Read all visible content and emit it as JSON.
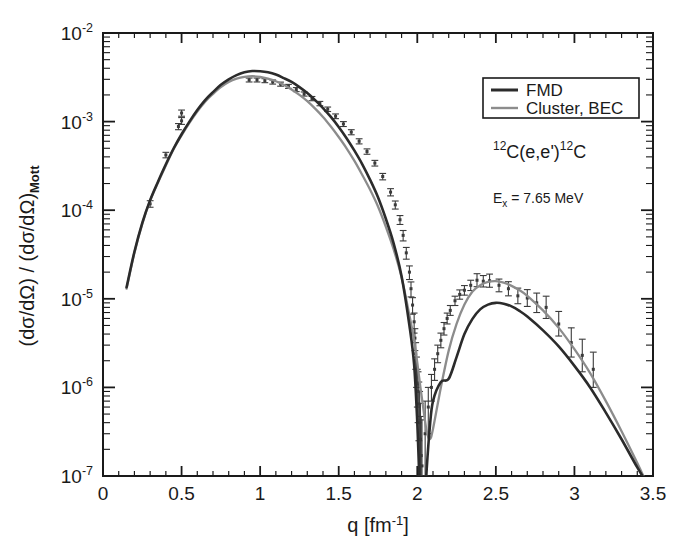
{
  "figure": {
    "title": "",
    "background": "#ffffff",
    "frame_color": "#1a1a1a"
  },
  "axes": {
    "x": {
      "label_main": "q [fm",
      "label_sup": "-1",
      "label_close": "]",
      "label_full": "q [fm-1]",
      "ticks": [
        "0",
        "0.5",
        "1",
        "1.5",
        "2",
        "2.5",
        "3",
        "3.5"
      ],
      "tick_values": [
        0,
        0.5,
        1,
        1.5,
        2,
        2.5,
        3,
        3.5
      ],
      "range": [
        0,
        3.5
      ],
      "scale": "linear"
    },
    "y": {
      "label_full": "(dσ/dΩ) / (dσ/dΩ)Mott",
      "label_part1": "(dσ/dΩ) / (dσ/dΩ)",
      "label_sub": "Mott",
      "ticks": [
        "-2",
        "-3",
        "-4",
        "-5",
        "-6",
        "-7"
      ],
      "tick_mantissa": "10",
      "tick_values": [
        0.01,
        0.001,
        0.0001,
        1e-05,
        1e-06,
        1e-07
      ],
      "range": [
        1e-07,
        0.01
      ],
      "scale": "log"
    }
  },
  "legend": {
    "position": "top-right",
    "entries": [
      {
        "label": "FMD",
        "color": "#2b2b2b",
        "width": 2.6
      },
      {
        "label": "Cluster, BEC",
        "color": "#8c8c8c",
        "width": 2.2
      }
    ]
  },
  "annotations": [
    {
      "name": "reaction-label",
      "sup1": "12",
      "text1": "C(e,e')",
      "sup2": "12",
      "text2": "C",
      "full": "12C(e,e')12C",
      "x": 510,
      "y": 152
    },
    {
      "name": "excitation-energy-label",
      "symbol": "E",
      "sub": "x",
      "text": " = 7.65 MeV",
      "full": "Ex = 7.65 MeV",
      "x": 508,
      "y": 198
    }
  ],
  "chart_data": {
    "type": "line",
    "title": "",
    "xlabel": "q [fm-1]",
    "ylabel": "(dsigma/dOmega) / (dsigma/dOmega)_Mott",
    "xlim": [
      0,
      3.5
    ],
    "ylim": [
      1e-07,
      0.01
    ],
    "xscale": "linear",
    "yscale": "log",
    "grid": false,
    "legend_position": "upper right",
    "series": [
      {
        "name": "FMD",
        "type": "line",
        "color": "#2b2b2b",
        "x": [
          0.15,
          0.2,
          0.25,
          0.3,
          0.35,
          0.4,
          0.45,
          0.5,
          0.55,
          0.6,
          0.65,
          0.7,
          0.75,
          0.8,
          0.85,
          0.9,
          0.95,
          1.0,
          1.05,
          1.1,
          1.15,
          1.2,
          1.25,
          1.3,
          1.35,
          1.4,
          1.45,
          1.5,
          1.55,
          1.6,
          1.65,
          1.7,
          1.75,
          1.8,
          1.85,
          1.9,
          1.95,
          1.98,
          2.0,
          2.02,
          2.04,
          2.06,
          2.08,
          2.1,
          2.15,
          2.2,
          2.25,
          2.3,
          2.35,
          2.4,
          2.45,
          2.5,
          2.55,
          2.6,
          2.65,
          2.7,
          2.8,
          2.9,
          3.0,
          3.1,
          3.2,
          3.3,
          3.4,
          3.45,
          3.5
        ],
        "y": [
          1.35e-05,
          3.4e-05,
          7.2e-05,
          0.00013,
          0.00021,
          0.00033,
          0.0005,
          0.00072,
          0.001,
          0.00135,
          0.00175,
          0.00215,
          0.0026,
          0.003,
          0.00335,
          0.0036,
          0.00372,
          0.0037,
          0.0036,
          0.0034,
          0.0031,
          0.0028,
          0.00245,
          0.0021,
          0.00175,
          0.00142,
          0.00113,
          0.00087,
          0.00065,
          0.00047,
          0.00033,
          0.00022,
          0.00014,
          8e-05,
          4.2e-05,
          1.8e-05,
          5e-06,
          1.8e-06,
          4e-07,
          5e-08,
          3e-08,
          1.2e-07,
          3.6e-07,
          7e-07,
          1.15e-06,
          1.25e-06,
          2.2e-06,
          4e-06,
          5.9e-06,
          7.6e-06,
          8.6e-06,
          9e-06,
          8.8e-06,
          8.2e-06,
          7.3e-06,
          6.3e-06,
          4.4e-06,
          2.9e-06,
          1.75e-06,
          1e-06,
          5.2e-07,
          2.6e-07,
          1.25e-07,
          9e-08,
          6.5e-08
        ]
      },
      {
        "name": "Cluster, BEC",
        "type": "line",
        "color": "#8c8c8c",
        "x": [
          0.15,
          0.2,
          0.25,
          0.3,
          0.35,
          0.4,
          0.45,
          0.5,
          0.55,
          0.6,
          0.65,
          0.7,
          0.75,
          0.8,
          0.85,
          0.9,
          0.95,
          1.0,
          1.05,
          1.1,
          1.15,
          1.2,
          1.25,
          1.3,
          1.35,
          1.4,
          1.45,
          1.5,
          1.55,
          1.6,
          1.65,
          1.7,
          1.75,
          1.8,
          1.85,
          1.9,
          1.95,
          1.98,
          2.0,
          2.02,
          2.04,
          2.06,
          2.08,
          2.1,
          2.15,
          2.2,
          2.25,
          2.3,
          2.35,
          2.4,
          2.45,
          2.5,
          2.55,
          2.6,
          2.65,
          2.7,
          2.8,
          2.9,
          3.0,
          3.1,
          3.2,
          3.3,
          3.4,
          3.45,
          3.5
        ],
        "y": [
          1.3e-05,
          3.3e-05,
          7e-05,
          0.000128,
          0.000205,
          0.00032,
          0.00049,
          0.0007,
          0.00097,
          0.0013,
          0.00168,
          0.00205,
          0.00245,
          0.0028,
          0.00305,
          0.0032,
          0.00325,
          0.0032,
          0.00305,
          0.00285,
          0.0026,
          0.0023,
          0.002,
          0.0017,
          0.0014,
          0.00113,
          0.00088,
          0.00067,
          0.0005,
          0.00036,
          0.00025,
          0.00017,
          0.00011,
          6.5e-05,
          3.6e-05,
          1.75e-05,
          6.5e-06,
          3.4e-06,
          1.9e-06,
          1e-06,
          5.5e-07,
          3.2e-07,
          2.6e-07,
          3.4e-07,
          1e-06,
          2.6e-06,
          5.2e-06,
          8.6e-06,
          1.2e-05,
          1.42e-05,
          1.55e-05,
          1.58e-05,
          1.52e-05,
          1.4e-05,
          1.25e-05,
          1.08e-05,
          7.4e-06,
          4.7e-06,
          2.7e-06,
          1.45e-06,
          7e-07,
          3.2e-07,
          1.4e-07,
          9e-08,
          5.5e-08
        ]
      }
    ],
    "data_points": {
      "name": "experimental data",
      "marker": "error-bar",
      "color": "#3a3a3a",
      "points": [
        {
          "x": 0.3,
          "y": 0.000118,
          "err_lo": 1e-05,
          "err_hi": 1e-05
        },
        {
          "x": 0.4,
          "y": 0.00042,
          "err_lo": 3e-05,
          "err_hi": 3e-05
        },
        {
          "x": 0.48,
          "y": 0.00088,
          "err_lo": 7e-05,
          "err_hi": 7e-05
        },
        {
          "x": 0.5,
          "y": 0.00102,
          "err_lo": 9e-05,
          "err_hi": 9e-05
        },
        {
          "x": 0.5,
          "y": 0.00125,
          "err_lo": 0.0001,
          "err_hi": 0.0001
        },
        {
          "x": 0.93,
          "y": 0.00295,
          "err_lo": 0.00015,
          "err_hi": 0.00015
        },
        {
          "x": 0.98,
          "y": 0.00295,
          "err_lo": 0.00015,
          "err_hi": 0.00015
        },
        {
          "x": 1.03,
          "y": 0.0029,
          "err_lo": 0.00015,
          "err_hi": 0.00015
        },
        {
          "x": 1.08,
          "y": 0.0028,
          "err_lo": 0.00015,
          "err_hi": 0.00015
        },
        {
          "x": 1.13,
          "y": 0.00265,
          "err_lo": 0.00014,
          "err_hi": 0.00014
        },
        {
          "x": 1.18,
          "y": 0.0025,
          "err_lo": 0.00013,
          "err_hi": 0.00013
        },
        {
          "x": 1.23,
          "y": 0.0023,
          "err_lo": 0.00012,
          "err_hi": 0.00012
        },
        {
          "x": 1.28,
          "y": 0.00205,
          "err_lo": 0.00011,
          "err_hi": 0.00011
        },
        {
          "x": 1.33,
          "y": 0.00182,
          "err_lo": 0.0001,
          "err_hi": 0.0001
        },
        {
          "x": 1.38,
          "y": 0.0016,
          "err_lo": 9e-05,
          "err_hi": 9e-05
        },
        {
          "x": 1.43,
          "y": 0.00138,
          "err_lo": 8e-05,
          "err_hi": 8e-05
        },
        {
          "x": 1.48,
          "y": 0.00115,
          "err_lo": 7e-05,
          "err_hi": 7e-05
        },
        {
          "x": 1.53,
          "y": 0.00094,
          "err_lo": 6e-05,
          "err_hi": 6e-05
        },
        {
          "x": 1.58,
          "y": 0.00076,
          "err_lo": 5e-05,
          "err_hi": 5e-05
        },
        {
          "x": 1.63,
          "y": 0.0006,
          "err_lo": 4e-05,
          "err_hi": 4e-05
        },
        {
          "x": 1.68,
          "y": 0.00046,
          "err_lo": 3.2e-05,
          "err_hi": 3.2e-05
        },
        {
          "x": 1.73,
          "y": 0.00034,
          "err_lo": 2.5e-05,
          "err_hi": 2.5e-05
        },
        {
          "x": 1.78,
          "y": 0.00024,
          "err_lo": 2e-05,
          "err_hi": 2e-05
        },
        {
          "x": 1.83,
          "y": 0.00016,
          "err_lo": 1.5e-05,
          "err_hi": 1.5e-05
        },
        {
          "x": 1.86,
          "y": 0.000115,
          "err_lo": 1.2e-05,
          "err_hi": 1.2e-05
        },
        {
          "x": 1.89,
          "y": 7.8e-05,
          "err_lo": 9e-06,
          "err_hi": 9e-06
        },
        {
          "x": 1.91,
          "y": 5.2e-05,
          "err_lo": 7e-06,
          "err_hi": 7e-06
        },
        {
          "x": 1.93,
          "y": 3.3e-05,
          "err_lo": 5e-06,
          "err_hi": 5e-06
        },
        {
          "x": 1.95,
          "y": 2e-05,
          "err_lo": 3.5e-06,
          "err_hi": 3.5e-06
        },
        {
          "x": 1.96,
          "y": 1.3e-05,
          "err_lo": 2.5e-06,
          "err_hi": 2.5e-06
        },
        {
          "x": 1.97,
          "y": 8.5e-06,
          "err_lo": 1.8e-06,
          "err_hi": 1.8e-06
        },
        {
          "x": 1.98,
          "y": 5.5e-06,
          "err_lo": 1.4e-06,
          "err_hi": 1.4e-06
        },
        {
          "x": 1.985,
          "y": 3.6e-06,
          "err_lo": 1e-06,
          "err_hi": 1e-06
        },
        {
          "x": 1.99,
          "y": 2.4e-06,
          "err_lo": 8e-07,
          "err_hi": 8e-07
        },
        {
          "x": 1.995,
          "y": 1.6e-06,
          "err_lo": 6e-07,
          "err_hi": 6e-07
        },
        {
          "x": 2.0,
          "y": 1.1e-06,
          "err_lo": 5e-07,
          "err_hi": 5e-07
        },
        {
          "x": 2.005,
          "y": 9e-07,
          "err_lo": 5e-07,
          "err_hi": 6e-07
        },
        {
          "x": 2.01,
          "y": 6.5e-07,
          "err_lo": 4e-07,
          "err_hi": 5e-07
        },
        {
          "x": 2.015,
          "y": 4e-07,
          "err_lo": 3e-07,
          "err_hi": 5e-07
        },
        {
          "x": 2.02,
          "y": 2.6e-07,
          "err_lo": 2e-07,
          "err_hi": 4e-07
        },
        {
          "x": 2.025,
          "y": 1.7e-07,
          "err_lo": 1.2e-07,
          "err_hi": 3e-07
        },
        {
          "x": 2.03,
          "y": 1.3e-07,
          "err_lo": 1e-07,
          "err_hi": 3e-07
        },
        {
          "x": 2.05,
          "y": 3e-07,
          "err_lo": 2e-07,
          "err_hi": 4e-07
        },
        {
          "x": 2.07,
          "y": 6e-07,
          "err_lo": 3e-07,
          "err_hi": 4e-07
        },
        {
          "x": 2.09,
          "y": 1e-06,
          "err_lo": 3e-07,
          "err_hi": 4e-07
        },
        {
          "x": 2.11,
          "y": 1.6e-06,
          "err_lo": 4e-07,
          "err_hi": 5e-07
        },
        {
          "x": 2.13,
          "y": 2.4e-06,
          "err_lo": 5e-07,
          "err_hi": 6e-07
        },
        {
          "x": 2.15,
          "y": 3.4e-06,
          "err_lo": 6e-07,
          "err_hi": 7e-07
        },
        {
          "x": 2.17,
          "y": 4.6e-06,
          "err_lo": 7e-07,
          "err_hi": 8e-07
        },
        {
          "x": 2.19,
          "y": 6e-06,
          "err_lo": 8e-07,
          "err_hi": 9e-07
        },
        {
          "x": 2.21,
          "y": 7.4e-06,
          "err_lo": 9e-07,
          "err_hi": 1e-06
        },
        {
          "x": 2.24,
          "y": 9.5e-06,
          "err_lo": 1.1e-06,
          "err_hi": 1.2e-06
        },
        {
          "x": 2.27,
          "y": 1.12e-05,
          "err_lo": 1.3e-06,
          "err_hi": 1.4e-06
        },
        {
          "x": 2.3,
          "y": 1.25e-05,
          "err_lo": 1.5e-06,
          "err_hi": 1.6e-06
        },
        {
          "x": 2.34,
          "y": 1.42e-05,
          "err_lo": 1.8e-06,
          "err_hi": 2e-06
        },
        {
          "x": 2.38,
          "y": 1.62e-05,
          "err_lo": 2.5e-06,
          "err_hi": 3e-06
        },
        {
          "x": 2.42,
          "y": 1.58e-05,
          "err_lo": 2.2e-06,
          "err_hi": 2.5e-06
        },
        {
          "x": 2.46,
          "y": 1.6e-05,
          "err_lo": 2.5e-06,
          "err_hi": 3e-06
        },
        {
          "x": 2.52,
          "y": 1.42e-05,
          "err_lo": 2.2e-06,
          "err_hi": 2.5e-06
        },
        {
          "x": 2.58,
          "y": 1.3e-05,
          "err_lo": 2.2e-06,
          "err_hi": 2.6e-06
        },
        {
          "x": 2.64,
          "y": 1.08e-05,
          "err_lo": 2e-06,
          "err_hi": 2.4e-06
        },
        {
          "x": 2.7,
          "y": 1.02e-05,
          "err_lo": 2e-06,
          "err_hi": 2.5e-06
        },
        {
          "x": 2.76,
          "y": 9e-06,
          "err_lo": 2e-06,
          "err_hi": 2.6e-06
        },
        {
          "x": 2.82,
          "y": 8e-06,
          "err_lo": 2e-06,
          "err_hi": 2.7e-06
        },
        {
          "x": 2.9,
          "y": 5.2e-06,
          "err_lo": 1.4e-06,
          "err_hi": 2e-06
        },
        {
          "x": 2.98,
          "y": 3.2e-06,
          "err_lo": 1e-06,
          "err_hi": 1.5e-06
        },
        {
          "x": 3.05,
          "y": 2.3e-06,
          "err_lo": 8e-07,
          "err_hi": 1.2e-06
        },
        {
          "x": 3.12,
          "y": 1.6e-06,
          "err_lo": 6e-07,
          "err_hi": 9e-07
        }
      ]
    }
  }
}
